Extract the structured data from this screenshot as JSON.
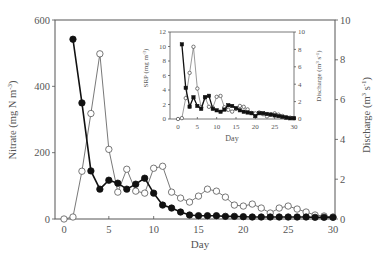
{
  "chart_data": [
    {
      "type": "line",
      "title": "",
      "xlabel": "Day",
      "ylabel": "Nitrate (mg N m-3)",
      "ylabel_right": "Discharge (m3 s-1)",
      "xlim": [
        0,
        30
      ],
      "ylim": [
        0,
        600
      ],
      "ylim_right": [
        0,
        10
      ],
      "xticks": [
        0,
        5,
        10,
        15,
        20,
        25,
        30
      ],
      "yticks": [
        0,
        200,
        400,
        600
      ],
      "yticks_right": [
        0,
        2,
        4,
        6,
        8,
        10
      ],
      "grid": false,
      "legend": "none",
      "series": [
        {
          "name": "Nitrate",
          "axis": "left",
          "marker": "filled-circle",
          "x": [
            1,
            2,
            3,
            4,
            5,
            6,
            7,
            8,
            9,
            10,
            11,
            12,
            13,
            14,
            15,
            16,
            17,
            18,
            19,
            20,
            21,
            22,
            23,
            24,
            25,
            26,
            27,
            28,
            29,
            30
          ],
          "values": [
            542,
            350,
            145,
            90,
            117,
            108,
            90,
            105,
            123,
            78,
            42,
            33,
            21,
            12,
            10,
            10,
            10,
            8,
            8,
            7,
            6,
            6,
            6,
            6,
            6,
            6,
            6,
            5,
            5,
            5
          ]
        },
        {
          "name": "Discharge",
          "axis": "right",
          "marker": "open-circle",
          "x": [
            0,
            1,
            2,
            3,
            4,
            5,
            6,
            7,
            8,
            9,
            10,
            11,
            12,
            13,
            14,
            15,
            16,
            17,
            18,
            19,
            20,
            21,
            22,
            23,
            24,
            25,
            26,
            27,
            28,
            29,
            30
          ],
          "values": [
            0,
            0.1,
            2.4,
            5.3,
            8.3,
            3.5,
            1.35,
            2.5,
            1.4,
            1.3,
            2.55,
            2.65,
            1.35,
            1.05,
            0.85,
            1.15,
            1.5,
            1.4,
            1.1,
            0.7,
            0.65,
            0.75,
            0.55,
            0.3,
            0.55,
            0.65,
            0.5,
            0.35,
            0.2,
            0.15,
            0.1
          ]
        }
      ]
    },
    {
      "type": "line",
      "title": "inset",
      "xlabel": "Day",
      "ylabel": "SRP (mg m-3)",
      "ylabel_right": "Discharge (m3 s-1)",
      "xlim": [
        0,
        30
      ],
      "ylim": [
        0,
        12
      ],
      "ylim_right": [
        0,
        10
      ],
      "xticks": [
        0,
        5,
        10,
        15,
        20,
        25,
        30
      ],
      "yticks": [
        0,
        2,
        4,
        6,
        8,
        10,
        12
      ],
      "yticks_right": [
        0,
        2,
        4,
        6,
        8,
        10
      ],
      "grid": false,
      "legend": "none",
      "series": [
        {
          "name": "SRP",
          "axis": "left",
          "marker": "filled-square",
          "x": [
            1,
            2,
            3,
            4,
            5,
            6,
            7,
            8,
            9,
            10,
            11,
            12,
            13,
            14,
            15,
            16,
            17,
            18,
            19,
            20,
            21,
            22,
            23,
            24,
            25,
            26,
            27,
            28,
            29,
            30
          ],
          "values": [
            10.3,
            4.3,
            1.7,
            3.0,
            1.8,
            1.4,
            3.0,
            3.2,
            1.4,
            1.2,
            1.0,
            1.3,
            1.9,
            1.8,
            1.5,
            1.2,
            1.0,
            0.9,
            0.8,
            0.4,
            0.8,
            0.8,
            0.7,
            0.6,
            0.5,
            0.4,
            0.3,
            0.2,
            0.1,
            0.1
          ]
        },
        {
          "name": "Discharge",
          "axis": "right",
          "marker": "open-circle",
          "x": [
            0,
            1,
            2,
            3,
            4,
            5,
            6,
            7,
            8,
            9,
            10,
            11,
            12,
            13,
            14,
            15,
            16,
            17,
            18,
            19,
            20,
            21,
            22,
            23,
            24,
            25,
            26,
            27,
            28,
            29,
            30
          ],
          "values": [
            0,
            0.1,
            2.4,
            5.3,
            8.3,
            3.5,
            1.35,
            2.5,
            1.4,
            1.3,
            2.55,
            2.65,
            1.35,
            1.05,
            0.85,
            1.15,
            1.5,
            1.4,
            1.1,
            0.7,
            0.65,
            0.75,
            0.55,
            0.3,
            0.55,
            0.65,
            0.5,
            0.35,
            0.2,
            0.15,
            0.1
          ]
        }
      ]
    }
  ],
  "labels": {
    "main_xlabel": "Day",
    "main_ylabel_left": "Nitrate (mg N m",
    "main_ylabel_left_sup": "-3",
    "main_ylabel_left_end": ")",
    "main_ylabel_right": "Discharge (m",
    "main_ylabel_right_sup1": "3",
    "main_ylabel_right_mid": " s",
    "main_ylabel_right_sup2": "-1",
    "main_ylabel_right_end": ")",
    "inset_xlabel": "Day",
    "inset_ylabel_left": "SRP (mg m",
    "inset_ylabel_left_sup": "-3",
    "inset_ylabel_left_end": ")",
    "inset_ylabel_right": "Discharge (m",
    "inset_ylabel_right_sup1": "3",
    "inset_ylabel_right_mid": " s",
    "inset_ylabel_right_sup2": "-1",
    "inset_ylabel_right_end": ")"
  },
  "colors": {
    "axis": "#555555",
    "filled_series": "#111111",
    "open_series": "#555555",
    "background": "#ffffff"
  }
}
